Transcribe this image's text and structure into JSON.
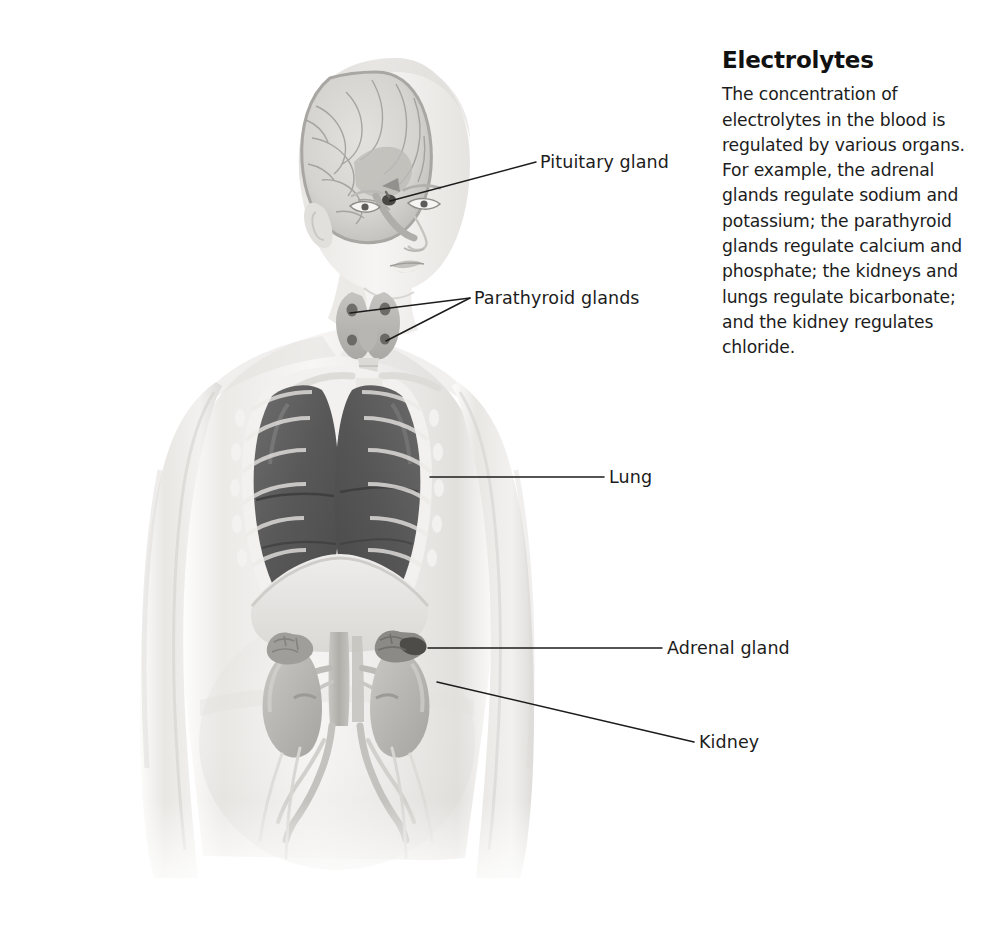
{
  "panel": {
    "title": "Electrolytes",
    "body": "The concentration of electrolytes in the blood is regulated by various organs. For example, the adrenal glands regulate sodium and potassium; the parathyroid glands regulate calcium and phosphate; the kidneys and lungs regulate bicarbonate; and the kidney regulates chloride."
  },
  "callouts": [
    {
      "id": "pituitary-gland",
      "label": "Pituitary gland"
    },
    {
      "id": "parathyroid-glands",
      "label": "Parathyroid glands"
    },
    {
      "id": "lung",
      "label": "Lung"
    },
    {
      "id": "adrenal-gland",
      "label": "Adrenal gland"
    },
    {
      "id": "kidney",
      "label": "Kidney"
    }
  ],
  "figure": {
    "colors": {
      "skin": "#f1f0ee",
      "skin_shadow": "#d8d6d3",
      "lung": "#5c5c5c",
      "organ": "#b9b7b4",
      "leader_line": "#1c1c1c",
      "text": "#1c1c1c",
      "background": "#ffffff"
    }
  }
}
